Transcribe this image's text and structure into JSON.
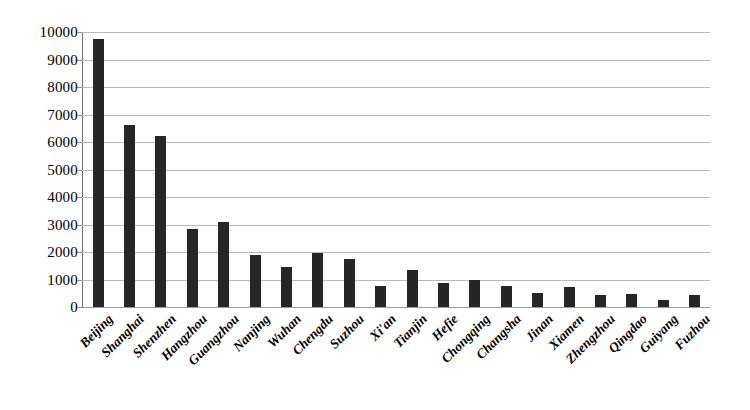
{
  "chart_data": {
    "type": "bar",
    "title": "",
    "subtitle": "",
    "xlabel": "",
    "ylabel": "",
    "ylim": [
      0,
      10000
    ],
    "ytick_step": 1000,
    "yticks": [
      10000,
      9000,
      8000,
      7000,
      6000,
      5000,
      4000,
      3000,
      2000,
      1000,
      0
    ],
    "grid": true,
    "legend": "none",
    "bar_color": "#262626",
    "gridline_color": "#b9b9b9",
    "axis_color": "#6e6e6e",
    "categories": [
      "Beijing",
      "Shanghai",
      "Shenzhen",
      "Hangzhou",
      "Guangzhou",
      "Nanjing",
      "Wuhan",
      "Chengdu",
      "Suzhou",
      "Xi'an",
      "Tianjin",
      "Hefie",
      "Chongqing",
      "Changsha",
      "Jinan",
      "Xiamen",
      "Zhengzhou",
      "Qingdao",
      "Guiyang",
      "Fuzhou"
    ],
    "values": [
      9750,
      6630,
      6230,
      2850,
      3080,
      1900,
      1450,
      1950,
      1760,
      760,
      1340,
      880,
      1000,
      780,
      500,
      730,
      450,
      460,
      270,
      440
    ]
  }
}
